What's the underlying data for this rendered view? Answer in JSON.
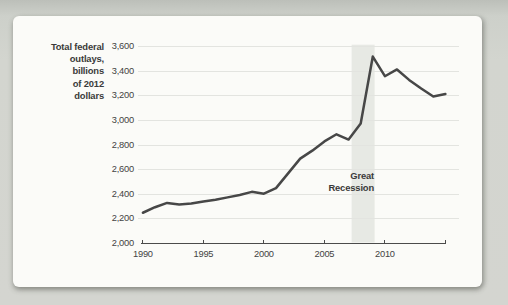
{
  "chart_data": {
    "type": "line",
    "title": "",
    "ylabel": "Total federal\noutlays,\nbillions\nof 2012\ndollars",
    "xlabel": "",
    "grid": true,
    "legend": "none",
    "xlim": [
      1990,
      2015
    ],
    "ylim": [
      2000,
      3600
    ],
    "years": [
      1990,
      1991,
      1992,
      1993,
      1994,
      1995,
      1996,
      1997,
      1998,
      1999,
      2000,
      2001,
      2002,
      2003,
      2004,
      2005,
      2006,
      2007,
      2008,
      2009,
      2010,
      2011,
      2012,
      2013,
      2014,
      2015
    ],
    "series": [
      {
        "name": "Total federal outlays, billions of 2012 dollars",
        "values": [
          2250,
          2295,
          2330,
          2318,
          2325,
          2342,
          2355,
          2375,
          2395,
          2420,
          2405,
          2450,
          2570,
          2690,
          2755,
          2830,
          2888,
          2845,
          2975,
          3520,
          3360,
          3415,
          3330,
          3260,
          3195,
          3215
        ]
      }
    ],
    "yticks": [
      {
        "value": 2000,
        "label": "2,000"
      },
      {
        "value": 2200,
        "label": "2,200"
      },
      {
        "value": 2400,
        "label": "2,400"
      },
      {
        "value": 2600,
        "label": "2,600"
      },
      {
        "value": 2800,
        "label": "2,800"
      },
      {
        "value": 3000,
        "label": "3,000"
      },
      {
        "value": 3200,
        "label": "3,200"
      },
      {
        "value": 3400,
        "label": "3,400"
      },
      {
        "value": 3600,
        "label": "3,600"
      }
    ],
    "xticks": [
      {
        "value": 1990,
        "label": "1990"
      },
      {
        "value": 1995,
        "label": "1995"
      },
      {
        "value": 2000,
        "label": "2000"
      },
      {
        "value": 2005,
        "label": "2005"
      },
      {
        "value": 2010,
        "label": "2010"
      }
    ],
    "annotation": {
      "label": "Great\nRecession",
      "band_x_start": 2007.25,
      "band_x_end": 2009.15
    },
    "colors": {
      "line": "#474747",
      "band": "#e7e9e4",
      "grid": "#e3e4e0",
      "axis": "#4b4b4b",
      "text": "#3a3a3a"
    }
  }
}
